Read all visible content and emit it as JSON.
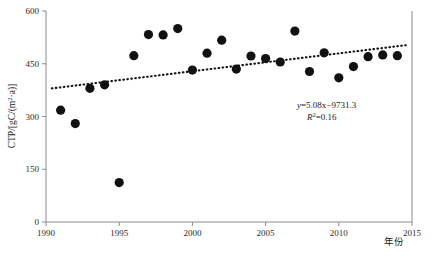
{
  "chart_data": {
    "type": "scatter",
    "title": "",
    "xlabel": "年份",
    "ylabel": "CTP/[gC/(m2·a)]",
    "ylabel_parts": {
      "prefix": "CTP/[gC/(m",
      "superscript": "2",
      "suffix": "·a)]"
    },
    "xlim": [
      1990,
      2015
    ],
    "ylim": [
      0,
      600
    ],
    "xticks": [
      1990,
      1995,
      2000,
      2005,
      2010,
      2015
    ],
    "xtick_labels": [
      "1990",
      "1995",
      "2000",
      "2005",
      "2010",
      "2015"
    ],
    "yticks": [
      0,
      150,
      300,
      450,
      600
    ],
    "ytick_labels": [
      "0",
      "150",
      "300",
      "450",
      "600"
    ],
    "grid": false,
    "legend": null,
    "marker_style": "filled-circle",
    "marker_color": "#111111",
    "x": [
      1991,
      1992,
      1993,
      1994,
      1995,
      1996,
      1997,
      1998,
      1999,
      2000,
      2001,
      2002,
      2003,
      2004,
      2005,
      2006,
      2007,
      2008,
      2009,
      2010,
      2011,
      2012,
      2013,
      2014
    ],
    "values": [
      318,
      280,
      380,
      390,
      112,
      473,
      533,
      532,
      550,
      432,
      480,
      517,
      435,
      472,
      465,
      455,
      543,
      428,
      481,
      410,
      442,
      470,
      475,
      473
    ],
    "points": [
      {
        "year": 1991,
        "ctp": 318
      },
      {
        "year": 1992,
        "ctp": 280
      },
      {
        "year": 1993,
        "ctp": 380
      },
      {
        "year": 1994,
        "ctp": 390
      },
      {
        "year": 1995,
        "ctp": 112
      },
      {
        "year": 1996,
        "ctp": 473
      },
      {
        "year": 1997,
        "ctp": 533
      },
      {
        "year": 1998,
        "ctp": 532
      },
      {
        "year": 1999,
        "ctp": 550
      },
      {
        "year": 2000,
        "ctp": 432
      },
      {
        "year": 2001,
        "ctp": 480
      },
      {
        "year": 2002,
        "ctp": 517
      },
      {
        "year": 2003,
        "ctp": 435
      },
      {
        "year": 2004,
        "ctp": 472
      },
      {
        "year": 2005,
        "ctp": 465
      },
      {
        "year": 2006,
        "ctp": 455
      },
      {
        "year": 2007,
        "ctp": 543
      },
      {
        "year": 2008,
        "ctp": 428
      },
      {
        "year": 2009,
        "ctp": 481
      },
      {
        "year": 2010,
        "ctp": 410
      },
      {
        "year": 2011,
        "ctp": 442
      },
      {
        "year": 2012,
        "ctp": 470
      },
      {
        "year": 2013,
        "ctp": 475
      },
      {
        "year": 2014,
        "ctp": 473
      }
    ],
    "trendline": {
      "style": "dotted",
      "slope": 5.08,
      "intercept": -9731.3,
      "r_squared": 0.16,
      "x_start": 1990.4,
      "x_end": 2014.6
    },
    "annotations": {
      "equation": "y=5.08x−9731.3",
      "equation_lhs": "y",
      "equation_rhs": "=5.08x−9731.3",
      "r2_lhs": "R",
      "r2_sup": "2",
      "r2_rhs": "=0.16"
    }
  }
}
